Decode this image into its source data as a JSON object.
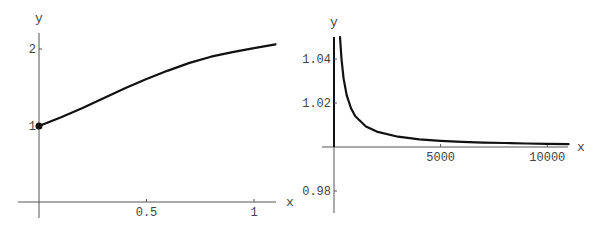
{
  "chart_data": [
    {
      "type": "line",
      "title": "",
      "xlabel": "x",
      "ylabel": "y",
      "xlim": [
        -0.06,
        1.1
      ],
      "ylim": [
        -0.2,
        2.2
      ],
      "grid": false,
      "legend": null,
      "x_ticks": [
        {
          "value": 0.5,
          "label": "0.5"
        },
        {
          "value": 1,
          "label": "1"
        }
      ],
      "y_ticks": [
        {
          "value": 1,
          "label": "1"
        },
        {
          "value": 2,
          "label": "2"
        }
      ],
      "annotations": [
        {
          "type": "point",
          "x": 0,
          "y": 1,
          "marker": "filled-circle"
        }
      ],
      "series": [
        {
          "name": "curve",
          "x": [
            0,
            0.1,
            0.2,
            0.3,
            0.4,
            0.5,
            0.6,
            0.7,
            0.8,
            0.9,
            1.0,
            1.1
          ],
          "y": [
            1.0,
            1.11,
            1.23,
            1.36,
            1.49,
            1.61,
            1.72,
            1.82,
            1.9,
            1.96,
            2.01,
            2.06
          ]
        }
      ]
    },
    {
      "type": "line",
      "title": "",
      "xlabel": "x",
      "ylabel": "y",
      "xlim": [
        0,
        11000
      ],
      "ylim": [
        0.97,
        1.05
      ],
      "grid": false,
      "legend": null,
      "x_ticks": [
        {
          "value": 5000,
          "label": "5000"
        },
        {
          "value": 10000,
          "label": "10000"
        }
      ],
      "y_ticks": [
        {
          "value": 0.98,
          "label": "0.98"
        },
        {
          "value": 1.02,
          "label": "1.02"
        },
        {
          "value": 1.04,
          "label": "1.04"
        }
      ],
      "series": [
        {
          "name": "curve",
          "x": [
            280,
            350,
            450,
            600,
            800,
            1000,
            1500,
            2000,
            3000,
            4000,
            5000,
            6000,
            7000,
            8000,
            9000,
            10000,
            11000
          ],
          "y": [
            1.05,
            1.04,
            1.0311,
            1.0233,
            1.0175,
            1.014,
            1.0093,
            1.007,
            1.0047,
            1.0035,
            1.0028,
            1.0023,
            1.002,
            1.0018,
            1.0016,
            1.0014,
            1.0013
          ]
        }
      ]
    }
  ],
  "plots": [
    {
      "frame": {
        "x0px": 39,
        "xscale": 215,
        "y0px": 203,
        "yscale": 77,
        "ybase": 0,
        "axis_x": {
          "x1": 18,
          "x2": 276,
          "y": 202
        },
        "axis_y": {
          "x": 39,
          "y1": 33,
          "y2": 218
        },
        "xlabel_pos": [
          286,
          206
        ],
        "ylabel_pos": [
          35,
          22
        ]
      },
      "xlabel": "x",
      "ylabel": "y"
    },
    {
      "frame": {
        "x0px": 334,
        "xscale": 0.02133,
        "y0px": 147,
        "yscale": 2200,
        "ybase": 1.0,
        "axis_x": {
          "x1": 322,
          "x2": 568,
          "y": 147
        },
        "axis_y": {
          "x": 334,
          "y1": 37,
          "y2": 213
        },
        "xlabel_pos": [
          577,
          151
        ],
        "ylabel_pos": [
          330,
          26
        ]
      },
      "xlabel": "x",
      "ylabel": "y"
    }
  ]
}
